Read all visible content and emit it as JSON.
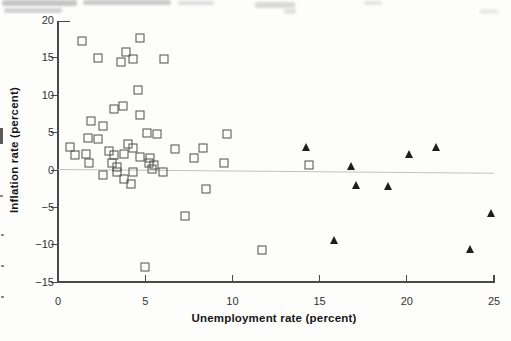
{
  "figure": {
    "x_axis": {
      "title": "Unemployment rate (percent)",
      "tick_labels": [
        "0",
        "5",
        "10",
        "15",
        "20",
        "25"
      ],
      "tick_values": [
        0,
        5,
        10,
        15,
        20,
        25
      ],
      "min": 0,
      "max": 25
    },
    "y_axis": {
      "title": "Inflation rate (percent)",
      "tick_labels": [
        "20",
        "15",
        "10",
        "5",
        "0",
        "−15",
        "−10",
        "−5"
      ],
      "tick_values": [
        20,
        15,
        10,
        5,
        0,
        -15,
        -10,
        -5
      ],
      "min": -15,
      "max": 20
    }
  },
  "chart_data": {
    "type": "scatter",
    "title": "",
    "xlabel": "Unemployment rate (percent)",
    "ylabel": "Inflation rate (percent)",
    "xlim": [
      0,
      25
    ],
    "ylim": [
      -15,
      20
    ],
    "grid": false,
    "legend": "none",
    "series": [
      {
        "name": "open-square-points",
        "marker": "square-open",
        "color": "#4f4f4f",
        "points": [
          [
            4.7,
            17.6
          ],
          [
            1.4,
            17.3
          ],
          [
            3.9,
            15.8
          ],
          [
            2.3,
            15.0
          ],
          [
            6.1,
            14.9
          ],
          [
            4.3,
            14.8
          ],
          [
            3.6,
            14.5
          ],
          [
            4.6,
            10.7
          ],
          [
            3.7,
            8.6
          ],
          [
            3.2,
            8.2
          ],
          [
            4.7,
            7.3
          ],
          [
            1.9,
            6.6
          ],
          [
            2.6,
            5.9
          ],
          [
            5.1,
            5.0
          ],
          [
            9.7,
            4.8
          ],
          [
            5.7,
            4.8
          ],
          [
            1.7,
            4.3
          ],
          [
            2.3,
            4.2
          ],
          [
            4.0,
            3.5
          ],
          [
            0.7,
            3.1
          ],
          [
            4.3,
            3.0
          ],
          [
            8.3,
            2.9
          ],
          [
            6.7,
            2.8
          ],
          [
            2.9,
            2.6
          ],
          [
            3.8,
            2.2
          ],
          [
            1.6,
            2.2
          ],
          [
            1.0,
            2.0
          ],
          [
            3.2,
            2.0
          ],
          [
            4.7,
            1.8
          ],
          [
            7.8,
            1.6
          ],
          [
            5.3,
            1.6
          ],
          [
            1.8,
            1.0
          ],
          [
            3.1,
            0.9
          ],
          [
            5.2,
            0.9
          ],
          [
            9.5,
            0.9
          ],
          [
            14.4,
            0.7
          ],
          [
            5.5,
            0.7
          ],
          [
            3.4,
            0.4
          ],
          [
            5.4,
            0.1
          ],
          [
            3.4,
            -0.2
          ],
          [
            4.3,
            -0.3
          ],
          [
            6.0,
            -0.3
          ],
          [
            2.6,
            -0.7
          ],
          [
            3.8,
            -1.2
          ],
          [
            4.2,
            -1.9
          ],
          [
            8.5,
            -2.5
          ],
          [
            7.3,
            -6.1
          ],
          [
            11.7,
            -10.7
          ],
          [
            5.0,
            -13.0
          ]
        ]
      },
      {
        "name": "filled-triangle-points",
        "marker": "triangle-filled",
        "color": "#1e1e1e",
        "points": [
          [
            14.2,
            3.3
          ],
          [
            21.7,
            3.3
          ],
          [
            20.1,
            2.3
          ],
          [
            16.8,
            0.8
          ],
          [
            17.1,
            -1.8
          ],
          [
            18.9,
            -1.9
          ],
          [
            24.8,
            -5.6
          ],
          [
            15.8,
            -9.2
          ],
          [
            23.6,
            -10.4
          ]
        ]
      }
    ],
    "trend_line": {
      "x1": 0,
      "y1": 0.1,
      "x2": 25,
      "y2": -0.4,
      "color": "#c2c2c2"
    }
  }
}
